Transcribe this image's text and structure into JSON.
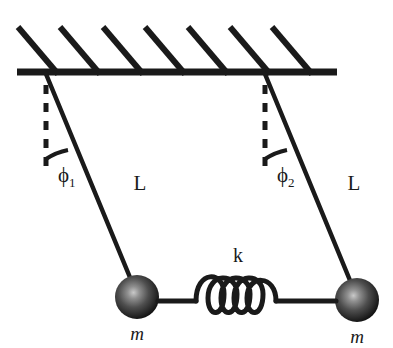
{
  "figure": {
    "type": "physics-diagram",
    "width": 393,
    "height": 348,
    "background_color": "#ffffff",
    "stroke_color": "#1a1a1a"
  },
  "labels": {
    "length_left": "L",
    "length_right": "L",
    "spring_constant": "k",
    "mass_left": "m",
    "mass_right": "m",
    "angle_left_symbol": "ϕ",
    "angle_left_subscript": "1",
    "angle_right_symbol": "ϕ",
    "angle_right_subscript": "2"
  },
  "elements": {
    "ceiling": {
      "name": "ceiling-bar",
      "x1": 17,
      "x2": 337,
      "y": 72,
      "thickness": 6,
      "hatch_count": 7,
      "hatch_color": "#1a1a1a"
    },
    "pendulum_left": {
      "pivot_x": 46,
      "pivot_y": 73,
      "bob_x": 137,
      "bob_y": 297,
      "bob_radius": 22,
      "rod_thickness": 4,
      "dashed_line_bottom": 168,
      "arc_radius": 58
    },
    "pendulum_right": {
      "pivot_x": 265,
      "pivot_y": 73,
      "bob_x": 357,
      "bob_y": 300,
      "bob_radius": 22,
      "rod_thickness": 4,
      "dashed_line_bottom": 168,
      "arc_radius": 58
    },
    "spring": {
      "name": "coupling-spring",
      "left_x": 159,
      "right_x": 335,
      "y": 300,
      "coil_count": 4,
      "coil_radius": 17,
      "thickness": 5
    },
    "bob_colors": {
      "highlight": "#b8b8b8",
      "mid": "#555555",
      "edge": "#151515"
    }
  },
  "label_positions": {
    "L_left": {
      "x": 140,
      "y": 188
    },
    "L_right": {
      "x": 352,
      "y": 188
    },
    "k": {
      "x": 238,
      "y": 260
    },
    "m_left": {
      "x": 137,
      "y": 337
    },
    "m_right": {
      "x": 357,
      "y": 340
    },
    "phi_left": {
      "x": 64,
      "y": 180
    },
    "phi_right": {
      "x": 283,
      "y": 180
    }
  }
}
